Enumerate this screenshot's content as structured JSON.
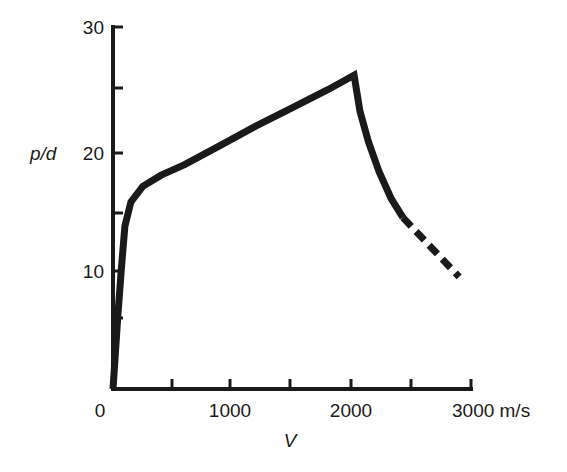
{
  "chart_data": {
    "type": "line",
    "title": "",
    "xlabel": "V",
    "ylabel": "p/d",
    "x_unit": "m/s",
    "xlim": [
      0,
      3000
    ],
    "ylim": [
      0,
      30
    ],
    "grid": false,
    "legend": null,
    "x_ticks": [
      0,
      500,
      1000,
      1500,
      2000,
      2500,
      3000
    ],
    "x_tick_labels": [
      "0",
      "",
      "1000",
      "",
      "2000",
      "",
      "3000 m/s"
    ],
    "y_ticks": [
      0,
      5,
      10,
      15,
      20,
      25,
      30
    ],
    "y_tick_labels": [
      "",
      "",
      "10",
      "",
      "20",
      "",
      "30"
    ],
    "series": [
      {
        "name": "p/d vs V (solid)",
        "style": "solid",
        "x": [
          0,
          40,
          70,
          100,
          150,
          250,
          400,
          600,
          900,
          1200,
          1500,
          1800,
          2020,
          2070,
          2140,
          2230,
          2330,
          2430
        ],
        "y": [
          0,
          6,
          10,
          13.5,
          15.5,
          16.8,
          17.7,
          18.6,
          20.2,
          21.8,
          23.3,
          24.8,
          26,
          23,
          20.5,
          18,
          15.8,
          14.2
        ]
      },
      {
        "name": "p/d vs V (extrapolated)",
        "style": "dashed",
        "x": [
          2430,
          2900
        ],
        "y": [
          14.2,
          9.3
        ]
      }
    ]
  },
  "labels": {
    "x_axis_title": "V",
    "y_axis_title": "p/d",
    "x_tick_0": "0",
    "x_tick_1000": "1000",
    "x_tick_2000": "2000",
    "x_tick_3000": "3000 m/s",
    "y_tick_10": "10",
    "y_tick_20": "20",
    "y_tick_30": "30"
  },
  "colors": {
    "ink": "#1a1a1a",
    "background": "#ffffff"
  }
}
